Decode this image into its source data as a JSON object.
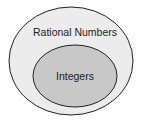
{
  "diagram": {
    "type": "venn",
    "sets": [
      {
        "label": "Rational Numbers",
        "fill": "#ececec",
        "role": "outer"
      },
      {
        "label": "Integers",
        "fill": "#c8c8c8",
        "role": "inner"
      }
    ],
    "stroke_color": "#222222"
  }
}
